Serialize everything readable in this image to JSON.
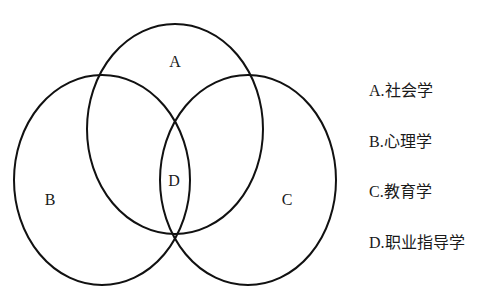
{
  "diagram": {
    "type": "venn",
    "sets": [
      {
        "id": "A",
        "label": "A",
        "cx": 175,
        "cy": 129,
        "rx": 88,
        "ry": 105,
        "label_x": 175,
        "label_y": 62
      },
      {
        "id": "B",
        "label": "B",
        "cx": 102,
        "cy": 180,
        "rx": 88,
        "ry": 105,
        "label_x": 50,
        "label_y": 199
      },
      {
        "id": "C",
        "label": "C",
        "cx": 248,
        "cy": 180,
        "rx": 88,
        "ry": 105,
        "label_x": 287,
        "label_y": 199
      }
    ],
    "intersection": {
      "id": "D",
      "label": "D",
      "label_x": 174,
      "label_y": 180
    },
    "stroke_color": "#111111"
  },
  "legend": {
    "items": [
      {
        "key": "A",
        "text": "A.社会学"
      },
      {
        "key": "B",
        "text": "B.心理学"
      },
      {
        "key": "C",
        "text": "C.教育学"
      },
      {
        "key": "D",
        "text": "D.职业指导学"
      }
    ]
  }
}
